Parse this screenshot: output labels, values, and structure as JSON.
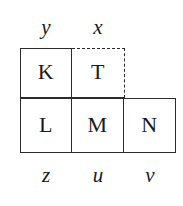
{
  "figure": {
    "type": "polyomino-grid-diagram",
    "colors": {
      "line": "#2b2b2b",
      "text": "#1a1a1a",
      "background": "#ffffff"
    },
    "top_labels": [
      {
        "text": "y",
        "column": 1
      },
      {
        "text": "x",
        "column": 2
      }
    ],
    "bottom_labels": [
      {
        "text": "z",
        "column": 1
      },
      {
        "text": "u",
        "column": 2
      },
      {
        "text": "v",
        "column": 3
      }
    ],
    "cells": [
      {
        "label": "K",
        "row": 1,
        "column": 1,
        "border_style": "solid"
      },
      {
        "label": "T",
        "row": 1,
        "column": 2,
        "border_style": "dashed-top-right"
      },
      {
        "label": "L",
        "row": 2,
        "column": 1,
        "border_style": "solid"
      },
      {
        "label": "M",
        "row": 2,
        "column": 2,
        "border_style": "solid"
      },
      {
        "label": "N",
        "row": 2,
        "column": 3,
        "border_style": "solid"
      }
    ]
  }
}
